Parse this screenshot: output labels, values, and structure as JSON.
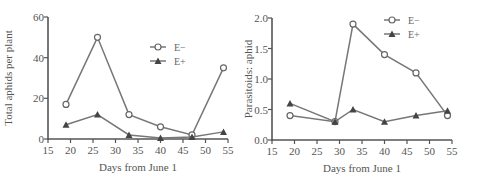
{
  "chart_data": [
    {
      "type": "line",
      "title": "",
      "xlabel": "Days from June 1",
      "ylabel": "Total aphids per plant",
      "xlim": [
        15,
        55
      ],
      "ylim": [
        0,
        60
      ],
      "xticks": [
        15,
        20,
        25,
        30,
        35,
        40,
        45,
        50,
        55
      ],
      "yticks": [
        0,
        20,
        40,
        60
      ],
      "grid": false,
      "legend_position": "upper right",
      "series": [
        {
          "name": "E−",
          "marker": "open-circle",
          "x": [
            19,
            26,
            33,
            40,
            47,
            54
          ],
          "values": [
            17,
            50,
            12,
            6,
            2,
            35
          ]
        },
        {
          "name": "E+",
          "marker": "filled-triangle",
          "x": [
            19,
            26,
            33,
            40,
            47,
            54
          ],
          "values": [
            7,
            12,
            2,
            0.5,
            1,
            3.5
          ]
        }
      ]
    },
    {
      "type": "line",
      "title": "",
      "xlabel": "Days from June 1",
      "ylabel": "Parasitoids: aphid",
      "xlim": [
        15,
        55
      ],
      "ylim": [
        0,
        2.0
      ],
      "xticks": [
        15,
        20,
        25,
        30,
        35,
        40,
        45,
        50,
        55
      ],
      "yticks": [
        "0.0",
        "0.5",
        "1.0",
        "1.5",
        "2.0"
      ],
      "grid": false,
      "legend_position": "upper right",
      "series": [
        {
          "name": "E−",
          "marker": "open-circle",
          "x": [
            19,
            29,
            33,
            40,
            47,
            54
          ],
          "values": [
            0.4,
            0.3,
            1.9,
            1.4,
            1.1,
            0.4
          ]
        },
        {
          "name": "E+",
          "marker": "filled-triangle",
          "x": [
            19,
            29,
            33,
            40,
            47,
            54
          ],
          "values": [
            0.6,
            0.3,
            0.5,
            0.3,
            0.4,
            0.48
          ]
        }
      ]
    }
  ]
}
